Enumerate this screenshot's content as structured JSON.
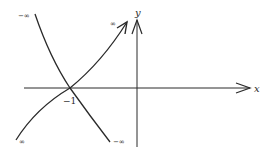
{
  "diagram": {
    "axes": {
      "x_label": "x",
      "y_label": "y"
    },
    "intersection": {
      "label": "−1"
    },
    "curves": [
      {
        "name": "decreasing-curve",
        "start_label": "−∞",
        "end_label": "−∞"
      },
      {
        "name": "increasing-curve",
        "start_label": "∞",
        "end_label": "∞"
      }
    ],
    "colors": {
      "stroke": "#2a2a2a",
      "background": "#ffffff"
    }
  }
}
